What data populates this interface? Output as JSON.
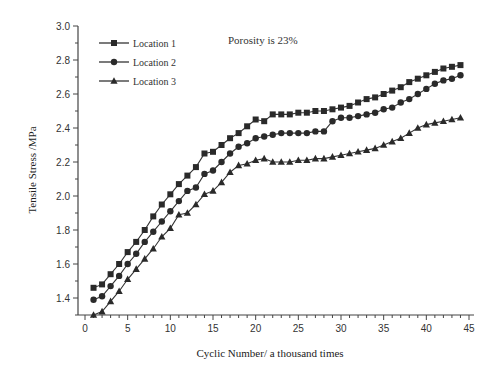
{
  "chart_data": {
    "type": "line",
    "title": "",
    "annotation": "Porosity is 23%",
    "xlabel": "Cyclic Number/ a thousand times",
    "ylabel": "Tensile Stress /MPa",
    "xlim": [
      0,
      45
    ],
    "ylim": [
      1.3,
      3.0
    ],
    "xticks": [
      0,
      5,
      10,
      15,
      20,
      25,
      30,
      35,
      40,
      45
    ],
    "yticks": [
      1.4,
      1.6,
      1.8,
      2.0,
      2.2,
      2.4,
      2.6,
      2.8,
      3.0
    ],
    "ytick_labels": [
      "1.4",
      "1.6",
      "1.8",
      "2.0",
      "2.2",
      "2.4",
      "2.6",
      "2.8",
      "3.0"
    ],
    "grid": false,
    "legend_position": "upper-left",
    "x": [
      1,
      2,
      3,
      4,
      5,
      6,
      7,
      8,
      9,
      10,
      11,
      12,
      13,
      14,
      15,
      16,
      17,
      18,
      19,
      20,
      21,
      22,
      23,
      24,
      25,
      26,
      27,
      28,
      29,
      30,
      31,
      32,
      33,
      34,
      35,
      36,
      37,
      38,
      39,
      40,
      41,
      42,
      43,
      44
    ],
    "series": [
      {
        "name": "Location 1",
        "marker": "square",
        "values": [
          1.46,
          1.48,
          1.54,
          1.6,
          1.67,
          1.73,
          1.8,
          1.88,
          1.95,
          2.01,
          2.07,
          2.12,
          2.17,
          2.25,
          2.26,
          2.3,
          2.34,
          2.37,
          2.41,
          2.45,
          2.44,
          2.48,
          2.48,
          2.48,
          2.49,
          2.49,
          2.5,
          2.5,
          2.51,
          2.52,
          2.53,
          2.55,
          2.57,
          2.58,
          2.6,
          2.62,
          2.64,
          2.67,
          2.69,
          2.71,
          2.73,
          2.75,
          2.76,
          2.77
        ]
      },
      {
        "name": "Location 2",
        "marker": "circle",
        "values": [
          1.39,
          1.41,
          1.47,
          1.53,
          1.6,
          1.66,
          1.73,
          1.79,
          1.85,
          1.91,
          1.97,
          2.03,
          2.05,
          2.13,
          2.15,
          2.2,
          2.25,
          2.29,
          2.31,
          2.34,
          2.35,
          2.36,
          2.37,
          2.37,
          2.37,
          2.37,
          2.38,
          2.38,
          2.44,
          2.46,
          2.46,
          2.47,
          2.48,
          2.49,
          2.51,
          2.52,
          2.55,
          2.57,
          2.6,
          2.63,
          2.66,
          2.68,
          2.69,
          2.71
        ]
      },
      {
        "name": "Location 3",
        "marker": "triangle",
        "values": [
          1.3,
          1.32,
          1.38,
          1.44,
          1.51,
          1.57,
          1.63,
          1.69,
          1.76,
          1.81,
          1.89,
          1.9,
          1.95,
          2.01,
          2.03,
          2.08,
          2.14,
          2.18,
          2.19,
          2.21,
          2.22,
          2.2,
          2.2,
          2.2,
          2.21,
          2.21,
          2.22,
          2.22,
          2.23,
          2.24,
          2.25,
          2.26,
          2.27,
          2.28,
          2.3,
          2.32,
          2.34,
          2.37,
          2.4,
          2.42,
          2.43,
          2.44,
          2.45,
          2.46
        ]
      }
    ]
  }
}
